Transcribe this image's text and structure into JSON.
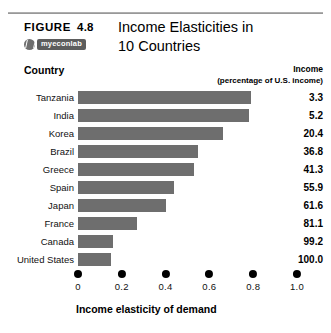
{
  "figure": {
    "label": "FIGURE",
    "number": "4.8",
    "badge_text": "myeconlab",
    "badge_icon": "myeconlab-logo-icon",
    "title_line1": "Income Elasticities in",
    "title_line2": "10 Countries"
  },
  "columns": {
    "country": "Country",
    "income": "Income",
    "income_sub": "(percentage of U.S. income)"
  },
  "chart_data": {
    "type": "bar",
    "orientation": "horizontal",
    "title": "Income Elasticities in 10 Countries",
    "xlabel": "Income elasticity of demand",
    "ylabel": "Country",
    "xlim": [
      0,
      1.0
    ],
    "xticks": [
      "0",
      "0.2",
      "0.4",
      "0.6",
      "0.8",
      "1.0"
    ],
    "xtick_values": [
      0,
      0.2,
      0.4,
      0.6,
      0.8,
      1.0
    ],
    "grid": false,
    "legend": "none",
    "bar_color": "#6e6e6e",
    "categories": [
      "Tanzania",
      "India",
      "Korea",
      "Brazil",
      "Greece",
      "Spain",
      "Japan",
      "France",
      "Canada",
      "United States"
    ],
    "values": [
      0.79,
      0.78,
      0.66,
      0.55,
      0.53,
      0.44,
      0.4,
      0.27,
      0.16,
      0.15
    ],
    "series": [
      {
        "name": "Income elasticity of demand",
        "values": [
          0.79,
          0.78,
          0.66,
          0.55,
          0.53,
          0.44,
          0.4,
          0.27,
          0.16,
          0.15
        ]
      },
      {
        "name": "Income (percentage of U.S. income)",
        "values": [
          "3.3",
          "5.2",
          "20.4",
          "36.8",
          "41.3",
          "55.9",
          "61.6",
          "81.1",
          "99.2",
          "100.0"
        ]
      }
    ],
    "rows": [
      {
        "country": "Tanzania",
        "elasticity": 0.79,
        "income": "3.3"
      },
      {
        "country": "India",
        "elasticity": 0.78,
        "income": "5.2"
      },
      {
        "country": "Korea",
        "elasticity": 0.66,
        "income": "20.4"
      },
      {
        "country": "Brazil",
        "elasticity": 0.55,
        "income": "36.8"
      },
      {
        "country": "Greece",
        "elasticity": 0.53,
        "income": "41.3"
      },
      {
        "country": "Spain",
        "elasticity": 0.44,
        "income": "55.9"
      },
      {
        "country": "Japan",
        "elasticity": 0.4,
        "income": "61.6"
      },
      {
        "country": "France",
        "elasticity": 0.27,
        "income": "81.1"
      },
      {
        "country": "Canada",
        "elasticity": 0.16,
        "income": "99.2"
      },
      {
        "country": "United States",
        "elasticity": 0.15,
        "income": "100.0"
      }
    ]
  }
}
